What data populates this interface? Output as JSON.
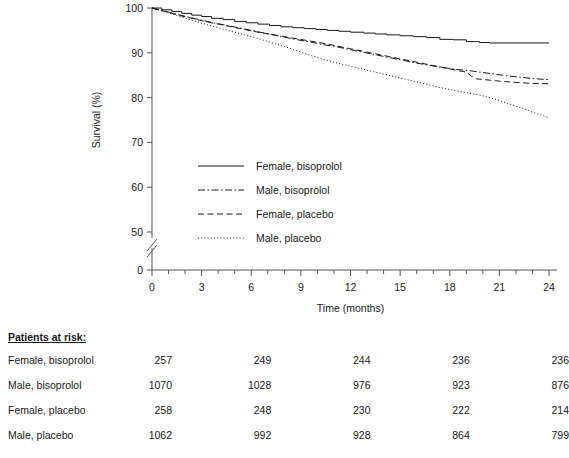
{
  "chart_data": {
    "type": "line",
    "title": "",
    "xlabel": "Time (months)",
    "ylabel": "Survival (%)",
    "xlim": [
      0,
      24
    ],
    "ylim": [
      50,
      100
    ],
    "y_axis_break": true,
    "y_break_from": 0,
    "y_break_to": 50,
    "xticks": [
      0,
      3,
      6,
      9,
      12,
      15,
      18,
      21,
      24
    ],
    "xtick_labels": [
      "0",
      "3",
      "6",
      "9",
      "12",
      "15",
      "18",
      "21",
      "24"
    ],
    "x_minor_tick_step": 1,
    "yticks": [
      0,
      50,
      60,
      70,
      80,
      90,
      100
    ],
    "ytick_labels": [
      "0",
      "50",
      "60",
      "70",
      "80",
      "90",
      "100"
    ],
    "grid": false,
    "legend_position": "center-left",
    "series": [
      {
        "name": "Female, bisoprolol",
        "linestyle": "solid",
        "color": "#1a1a1a",
        "x": [
          0,
          0.6,
          1.2,
          1.8,
          2.4,
          3.0,
          3.6,
          4.3,
          5.0,
          5.7,
          6.4,
          7.1,
          7.8,
          8.5,
          9.2,
          9.9,
          10.6,
          11.3,
          12.0,
          12.8,
          13.5,
          14.2,
          15.0,
          15.8,
          16.6,
          17.4,
          18.2,
          19.0,
          19.8,
          20.4,
          24.0
        ],
        "y": [
          100.0,
          99.6,
          99.2,
          98.8,
          98.4,
          98.1,
          97.7,
          97.4,
          97.0,
          96.7,
          96.4,
          96.1,
          95.8,
          95.6,
          95.4,
          95.2,
          95.0,
          94.8,
          94.6,
          94.4,
          94.2,
          94.0,
          93.8,
          93.6,
          93.4,
          93.0,
          92.9,
          92.5,
          92.3,
          92.2,
          92.2
        ]
      },
      {
        "name": "Male, bisoprolol",
        "linestyle": "dashdot",
        "color": "#1a1a1a",
        "x": [
          0,
          0.8,
          1.6,
          2.4,
          3.2,
          4.0,
          4.8,
          5.6,
          6.4,
          7.2,
          8.0,
          8.8,
          9.6,
          10.4,
          11.2,
          12.0,
          12.8,
          13.6,
          14.4,
          15.2,
          16.0,
          16.8,
          17.6,
          18.4,
          19.2,
          20.0,
          20.8,
          21.6,
          22.4,
          23.2,
          24.0
        ],
        "y": [
          100.0,
          99.3,
          98.5,
          97.8,
          97.1,
          96.5,
          95.9,
          95.3,
          94.7,
          94.1,
          93.5,
          92.9,
          92.4,
          91.8,
          91.3,
          90.7,
          90.1,
          89.5,
          88.9,
          88.3,
          87.7,
          87.2,
          86.7,
          86.3,
          86.0,
          85.6,
          85.2,
          84.8,
          84.5,
          84.2,
          84.0
        ]
      },
      {
        "name": "Female, placebo",
        "linestyle": "dashed",
        "color": "#1a1a1a",
        "x": [
          0,
          0.8,
          1.6,
          2.4,
          3.2,
          4.0,
          4.8,
          5.6,
          6.4,
          7.2,
          8.0,
          8.8,
          9.6,
          10.4,
          11.2,
          12.0,
          12.8,
          13.6,
          14.4,
          15.2,
          16.0,
          16.8,
          17.6,
          18.4,
          19.0,
          19.3,
          19.6,
          20.4,
          21.2,
          22.0,
          22.8,
          24.0
        ],
        "y": [
          100.0,
          99.2,
          98.4,
          97.7,
          97.0,
          96.4,
          95.8,
          95.2,
          94.6,
          94.1,
          93.6,
          93.1,
          92.6,
          92.1,
          91.5,
          90.9,
          90.3,
          89.7,
          89.1,
          88.5,
          87.9,
          87.3,
          86.7,
          86.1,
          85.7,
          84.8,
          84.2,
          83.9,
          83.6,
          83.4,
          83.2,
          83.1
        ]
      },
      {
        "name": "Male, placebo",
        "linestyle": "dotted",
        "color": "#1a1a1a",
        "x": [
          0,
          0.8,
          1.6,
          2.4,
          3.2,
          4.0,
          4.8,
          5.6,
          6.4,
          7.2,
          8.0,
          8.8,
          9.6,
          10.4,
          11.2,
          12.0,
          12.8,
          13.6,
          14.4,
          15.2,
          16.0,
          16.8,
          17.6,
          18.4,
          19.2,
          20.0,
          20.8,
          21.6,
          22.4,
          23.2,
          24.0
        ],
        "y": [
          100.0,
          99.1,
          98.2,
          97.3,
          96.4,
          95.6,
          94.8,
          94.0,
          93.2,
          92.3,
          91.4,
          90.4,
          89.4,
          88.5,
          87.7,
          87.0,
          86.3,
          85.6,
          84.9,
          84.2,
          83.5,
          82.8,
          82.1,
          81.5,
          81.0,
          80.4,
          79.6,
          78.6,
          77.6,
          76.5,
          75.5
        ]
      }
    ]
  },
  "legend": {
    "items": [
      {
        "label": "Female, bisoprolol",
        "style": "solid"
      },
      {
        "label": "Male, bisoprolol",
        "style": "dashdot"
      },
      {
        "label": "Female, placebo",
        "style": "dashed"
      },
      {
        "label": "Male, placebo",
        "style": "dotted"
      }
    ]
  },
  "risk_table": {
    "header": "Patients at risk:",
    "columns": [
      "0",
      "6",
      "12",
      "18",
      "24"
    ],
    "rows": [
      {
        "label": "Female, bisoprolol",
        "values": [
          "257",
          "249",
          "244",
          "236",
          "236"
        ]
      },
      {
        "label": "Male, bisoprolol",
        "values": [
          "1070",
          "1028",
          "976",
          "923",
          "876"
        ]
      },
      {
        "label": "Female, placebo",
        "values": [
          "258",
          "248",
          "230",
          "222",
          "214"
        ]
      },
      {
        "label": "Male, placebo",
        "values": [
          "1062",
          "992",
          "928",
          "864",
          "799"
        ]
      }
    ]
  }
}
